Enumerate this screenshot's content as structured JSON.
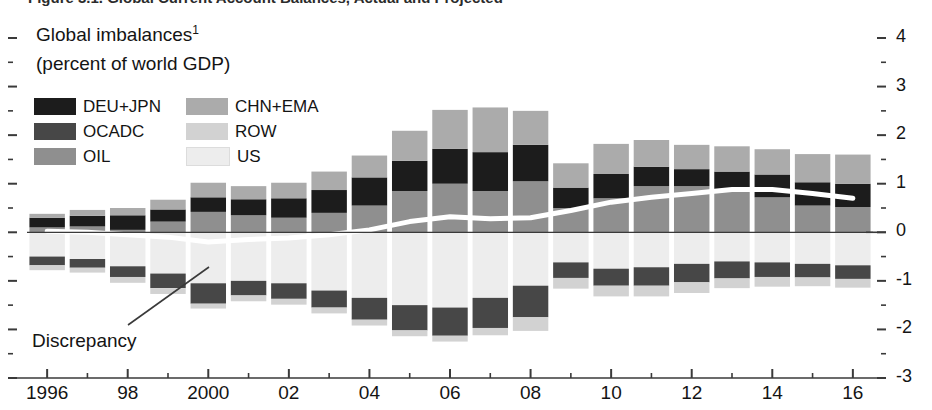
{
  "figure": {
    "caption_cutoff": "Figure 3.1. Global Current Account Balances, Actual and Projected",
    "title_line1": "Global imbalances",
    "title_superscript": "1",
    "title_line2": "(percent of world GDP)"
  },
  "annotations": {
    "discrepancy_label": "Discrepancy"
  },
  "colors": {
    "deu_jpn": "#1c1c1c",
    "ocadc": "#474747",
    "oil": "#8f8f8f",
    "chn_ema": "#ababab",
    "row": "#d2d2d2",
    "us": "#ededed",
    "line": "#ffffff",
    "axis": "#3a3a3a",
    "text": "#141414"
  },
  "legend": {
    "position": "inside-top-left",
    "columns": [
      [
        {
          "label": "DEU+JPN",
          "color": "#1c1c1c",
          "key": "deu_jpn"
        },
        {
          "label": "OCADC",
          "color": "#474747",
          "key": "ocadc"
        },
        {
          "label": "OIL",
          "color": "#8f8f8f",
          "key": "oil"
        }
      ],
      [
        {
          "label": "CHN+EMA",
          "color": "#ababab",
          "key": "chn_ema"
        },
        {
          "label": "ROW",
          "color": "#d2d2d2",
          "key": "row"
        },
        {
          "label": "US",
          "color": "#ededed",
          "key": "us"
        }
      ]
    ]
  },
  "chart_data": {
    "type": "bar",
    "stacked": true,
    "xlabel": "",
    "ylabel": "",
    "ylim": [
      -3,
      4
    ],
    "yticks": [
      4,
      3,
      2,
      1,
      0,
      -1,
      -2,
      -3
    ],
    "ytick_labels": [
      "4",
      "3",
      "2",
      "1",
      "0",
      "-1",
      "-2",
      "-3"
    ],
    "yminor_step": 0.5,
    "grid": false,
    "x": [
      1996,
      1997,
      1998,
      1999,
      2000,
      2001,
      2002,
      2003,
      2004,
      2005,
      2006,
      2007,
      2008,
      2009,
      2010,
      2011,
      2012,
      2013,
      2014,
      2015,
      2016
    ],
    "xtick_values": [
      1996,
      1998,
      2000,
      2002,
      2004,
      2006,
      2008,
      2010,
      2012,
      2014,
      2016
    ],
    "xtick_labels": [
      "1996",
      "98",
      "2000",
      "02",
      "04",
      "06",
      "08",
      "10",
      "12",
      "14",
      "16"
    ],
    "series": [
      {
        "name": "OIL",
        "key": "oil",
        "color": "#8f8f8f",
        "values": [
          0.1,
          0.12,
          0.05,
          0.22,
          0.42,
          0.35,
          0.3,
          0.4,
          0.55,
          0.85,
          1.0,
          0.85,
          1.05,
          0.5,
          0.7,
          0.95,
          0.95,
          0.85,
          0.72,
          0.55,
          0.52
        ]
      },
      {
        "name": "DEU+JPN",
        "key": "deu_jpn",
        "color": "#1c1c1c",
        "values": [
          0.2,
          0.22,
          0.3,
          0.25,
          0.3,
          0.33,
          0.4,
          0.47,
          0.58,
          0.62,
          0.72,
          0.8,
          0.75,
          0.42,
          0.5,
          0.4,
          0.35,
          0.4,
          0.47,
          0.48,
          0.48
        ]
      },
      {
        "name": "CHN+EMA",
        "key": "chn_ema",
        "color": "#ababab",
        "values": [
          0.08,
          0.12,
          0.15,
          0.2,
          0.3,
          0.27,
          0.32,
          0.38,
          0.45,
          0.62,
          0.8,
          0.92,
          0.7,
          0.5,
          0.62,
          0.55,
          0.5,
          0.52,
          0.52,
          0.58,
          0.6
        ]
      },
      {
        "name": "US",
        "key": "us",
        "color": "#ededed",
        "values": [
          -0.5,
          -0.55,
          -0.7,
          -0.85,
          -1.05,
          -1.0,
          -1.05,
          -1.2,
          -1.35,
          -1.5,
          -1.55,
          -1.35,
          -1.1,
          -0.62,
          -0.75,
          -0.72,
          -0.65,
          -0.6,
          -0.62,
          -0.65,
          -0.68
        ]
      },
      {
        "name": "OCADC",
        "key": "ocadc",
        "color": "#474747",
        "values": [
          -0.18,
          -0.18,
          -0.22,
          -0.3,
          -0.42,
          -0.3,
          -0.32,
          -0.35,
          -0.45,
          -0.52,
          -0.58,
          -0.62,
          -0.65,
          -0.32,
          -0.35,
          -0.38,
          -0.38,
          -0.35,
          -0.3,
          -0.28,
          -0.28
        ]
      },
      {
        "name": "ROW",
        "key": "row",
        "color": "#d2d2d2",
        "values": [
          -0.1,
          -0.1,
          -0.12,
          -0.12,
          -0.1,
          -0.12,
          -0.12,
          -0.12,
          -0.12,
          -0.12,
          -0.12,
          -0.15,
          -0.28,
          -0.22,
          -0.22,
          -0.22,
          -0.22,
          -0.2,
          -0.2,
          -0.18,
          -0.18
        ]
      }
    ],
    "line_series": {
      "name": "Discrepancy",
      "color": "#ffffff",
      "values": [
        0.02,
        0.0,
        -0.05,
        -0.1,
        -0.2,
        -0.15,
        -0.12,
        -0.05,
        0.05,
        0.22,
        0.32,
        0.28,
        0.3,
        0.45,
        0.62,
        0.72,
        0.8,
        0.88,
        0.88,
        0.8,
        0.7
      ]
    }
  }
}
